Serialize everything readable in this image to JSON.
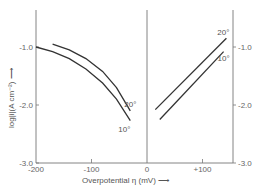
{
  "chart_data": {
    "type": "line",
    "title": "",
    "xlabel": "Overpotential η (mV) ⟶",
    "ylabel": "log|i|(A cm⁻²) ⟶",
    "xlim": [
      -200,
      155
    ],
    "ylim": [
      -3.0,
      -0.5
    ],
    "x_ticks": [
      {
        "value": -200,
        "label": "-200"
      },
      {
        "value": -100,
        "label": "-100"
      },
      {
        "value": 0,
        "label": "0"
      },
      {
        "value": 100,
        "label": "+100"
      }
    ],
    "y_ticks_left": [
      {
        "value": -1.0,
        "label": "-1.0"
      },
      {
        "value": -2.0,
        "label": "-2.0"
      },
      {
        "value": -3.0,
        "label": "-3.0"
      }
    ],
    "y_ticks_right": [
      {
        "value": -1.0,
        "label": "-1.0"
      },
      {
        "value": -2.0,
        "label": "-2.0"
      },
      {
        "value": -3.0,
        "label": "-3.0"
      }
    ],
    "grid": false,
    "series": [
      {
        "name": "10° (cathodic)",
        "label": "10°",
        "x": [
          -200,
          -170,
          -140,
          -110,
          -80,
          -55,
          -30
        ],
        "y": [
          -1.0,
          -1.08,
          -1.2,
          -1.38,
          -1.62,
          -1.9,
          -2.27
        ]
      },
      {
        "name": "20° (cathodic)",
        "label": "20°",
        "x": [
          -170,
          -140,
          -110,
          -80,
          -55,
          -30
        ],
        "y": [
          -0.95,
          -1.05,
          -1.2,
          -1.42,
          -1.7,
          -2.1
        ]
      },
      {
        "name": "20° (anodic)",
        "label": "20°",
        "x": [
          15,
          143
        ],
        "y": [
          -2.08,
          -0.85
        ]
      },
      {
        "name": "10° (anodic)",
        "label": "10°",
        "x": [
          23,
          138
        ],
        "y": [
          -2.25,
          -1.08
        ]
      }
    ]
  }
}
